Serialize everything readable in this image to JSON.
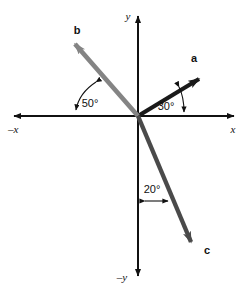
{
  "figure": {
    "background_color": "#ffffff",
    "width": 250,
    "height": 294
  },
  "axes": {
    "origin": {
      "x": 138,
      "y": 116
    },
    "color": "#111111",
    "x_positive_label": "x",
    "x_negative_label": "–x",
    "y_positive_label": "y",
    "y_negative_label": "–y",
    "x_left_end": {
      "x": 8,
      "y": 116
    },
    "x_right_end": {
      "x": 240,
      "y": 116
    },
    "y_top_end": {
      "x": 138,
      "y": 10
    },
    "y_bottom_end": {
      "x": 138,
      "y": 282
    }
  },
  "vectors": [
    {
      "name": "a",
      "label": "a",
      "color": "#1a1a1a",
      "angle_deg": 30,
      "reference": "+x axis",
      "direction": "up-right",
      "tip": {
        "x": 207,
        "y": 71
      },
      "label_pos": {
        "x": 194,
        "y": 62
      }
    },
    {
      "name": "b",
      "label": "b",
      "color": "#848484",
      "angle_deg": 50,
      "reference": "–x axis",
      "direction": "up-left",
      "tip": {
        "x": 67,
        "y": 38
      },
      "label_pos": {
        "x": 75,
        "y": 32
      }
    },
    {
      "name": "c",
      "label": "c",
      "color": "#4a4a4a",
      "angle_deg": 20,
      "reference": "–y axis",
      "direction": "down-right",
      "tip": {
        "x": 196,
        "y": 250
      },
      "label_pos": {
        "x": 203,
        "y": 253
      }
    }
  ],
  "angle_annotations": [
    {
      "id": "angle-30",
      "label": "30°",
      "value": 30,
      "unit": "degrees",
      "between": [
        "vector a",
        "+x axis"
      ],
      "label_pos": {
        "x": 163,
        "y": 110
      }
    },
    {
      "id": "angle-50",
      "label": "50°",
      "value": 50,
      "unit": "degrees",
      "between": [
        "vector b",
        "–x axis"
      ],
      "label_pos": {
        "x": 76,
        "y": 107
      }
    },
    {
      "id": "angle-20",
      "label": "20°",
      "value": 20,
      "unit": "degrees",
      "between": [
        "vector c",
        "–y axis"
      ],
      "label_pos": {
        "x": 140,
        "y": 196
      }
    }
  ]
}
